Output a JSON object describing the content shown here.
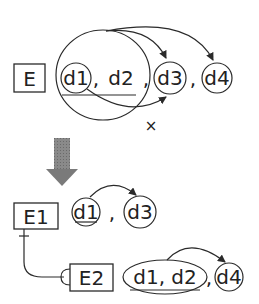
{
  "before": {
    "entity": "E",
    "attributes": [
      "d1",
      "d2",
      "d3",
      "d4"
    ],
    "separators": [
      ",",
      ",",
      ","
    ],
    "invalid_marker": "×"
  },
  "transform_arrow": {
    "color": "#7a7a7a"
  },
  "after": {
    "entity1": {
      "label": "E1",
      "attributes": [
        "d1",
        "d3"
      ],
      "separators": [
        ","
      ]
    },
    "entity2": {
      "label": "E2",
      "attributes": [
        "d1, d2",
        "d4"
      ],
      "separators": [
        ","
      ]
    }
  },
  "colors": {
    "stroke": "#2a2a2a",
    "text": "#222222",
    "arrow_fill": "#7a7a7a"
  }
}
